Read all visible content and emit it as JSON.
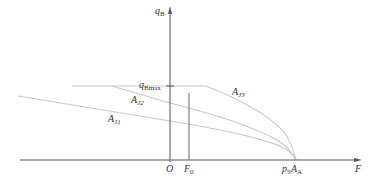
{
  "diagram": {
    "axes": {
      "y_label": {
        "main": "q",
        "sub": "B"
      },
      "x_label": "F",
      "origin_label": "O"
    },
    "ticks": {
      "q_bmax": {
        "main": "q",
        "sub": "Bmax"
      },
      "f0": {
        "main": "F",
        "sub": "0"
      },
      "ps_aa": {
        "main1": "p",
        "sub1": "S",
        "main2": "A",
        "sub2": "A"
      }
    },
    "curves": [
      {
        "id": "AJ1",
        "label": {
          "main": "A",
          "sub": "J1"
        }
      },
      {
        "id": "AJ2",
        "label": {
          "main": "A",
          "sub": "J2"
        }
      },
      {
        "id": "AJ3",
        "label": {
          "main": "A",
          "sub": "J3"
        }
      }
    ],
    "colors": {
      "axis": "#555555",
      "curve": "#c8c8c8",
      "text": "#333333"
    }
  }
}
